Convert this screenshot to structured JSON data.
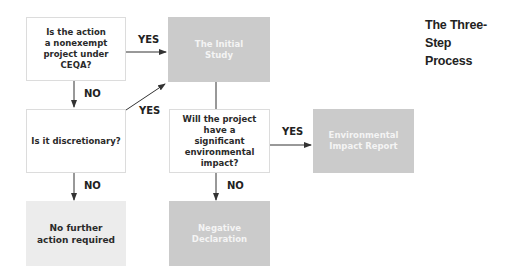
{
  "title": {
    "line1": "The Three-Step",
    "line2": "Process"
  },
  "nodes": {
    "q_nonexempt": "Is the action a nonexempt project under CEQA?",
    "q_discretionary": "Is it discretionary?",
    "q_significant": "Will the project have a significant environmental impact?",
    "initial_study": "The Initial Study",
    "no_further_action": "No further action required",
    "negative_declaration": "Negative Declaration",
    "eir": "Environmental Impact Report"
  },
  "edges": {
    "nonexempt_yes": "YES",
    "nonexempt_no": "NO",
    "discretionary_yes": "YES",
    "discretionary_no": "NO",
    "significant_yes": "YES",
    "significant_no": "NO"
  },
  "colors": {
    "question_fill": "#ffffff",
    "question_border": "#dcdcdc",
    "result_fill": "#cbcbcb",
    "result_text": "#f4f4f4",
    "terminal_fill": "#ececec",
    "arrow": "#333333"
  }
}
